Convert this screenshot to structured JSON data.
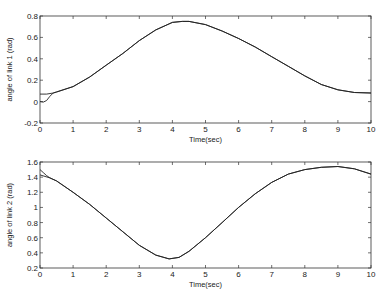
{
  "chart_data": [
    {
      "type": "line",
      "title": "",
      "xlabel": "Time(sec)",
      "ylabel": "angle of link 1 (rad)",
      "xlim": [
        0,
        10
      ],
      "ylim": [
        -0.2,
        0.8
      ],
      "xticks": [
        "0",
        "1",
        "2",
        "3",
        "4",
        "5",
        "6",
        "7",
        "8",
        "9",
        "10"
      ],
      "yticks": [
        "-0.2",
        "0",
        "0.2",
        "0.4",
        "0.6",
        "0.8"
      ],
      "grid": false,
      "series": [
        {
          "name": "actual",
          "x": [
            0,
            0.1,
            0.2,
            0.3,
            0.4,
            0.5,
            1,
            1.5,
            2,
            2.5,
            3,
            3.5,
            4,
            4.3,
            4.5,
            5,
            5.5,
            6,
            6.5,
            7,
            7.5,
            8,
            8.5,
            9,
            9.5,
            10
          ],
          "values": [
            0.0,
            -0.005,
            0.01,
            0.05,
            0.08,
            0.09,
            0.14,
            0.23,
            0.34,
            0.45,
            0.57,
            0.67,
            0.74,
            0.75,
            0.75,
            0.72,
            0.66,
            0.59,
            0.51,
            0.42,
            0.33,
            0.24,
            0.16,
            0.11,
            0.085,
            0.08
          ]
        },
        {
          "name": "reference",
          "x": [
            0,
            0.2,
            0.4,
            0.5,
            1,
            1.5,
            2,
            2.5,
            3,
            3.5,
            4,
            4.3,
            4.5,
            5,
            5.5,
            6,
            6.5,
            7,
            7.5,
            8,
            8.5,
            9,
            9.5,
            10
          ],
          "values": [
            0.07,
            0.07,
            0.08,
            0.09,
            0.14,
            0.23,
            0.34,
            0.45,
            0.57,
            0.67,
            0.74,
            0.75,
            0.75,
            0.72,
            0.66,
            0.59,
            0.51,
            0.42,
            0.33,
            0.24,
            0.16,
            0.11,
            0.085,
            0.08
          ]
        }
      ]
    },
    {
      "type": "line",
      "title": "",
      "xlabel": "Time(sec)",
      "ylabel": "angle of link 2 (rad)",
      "xlim": [
        0,
        10
      ],
      "ylim": [
        0.2,
        1.6
      ],
      "xticks": [
        "0",
        "1",
        "2",
        "3",
        "4",
        "5",
        "6",
        "7",
        "8",
        "9",
        "10"
      ],
      "yticks": [
        "0.2",
        "0.4",
        "0.6",
        "0.8",
        "1",
        "1.2",
        "1.4",
        "1.6"
      ],
      "grid": false,
      "series": [
        {
          "name": "actual",
          "x": [
            0,
            0.1,
            0.2,
            0.3,
            0.5,
            1,
            1.5,
            2,
            2.5,
            3,
            3.5,
            3.9,
            4.2,
            4.5,
            5,
            5.5,
            6,
            6.5,
            7,
            7.5,
            8,
            8.5,
            9,
            9.5,
            10
          ],
          "values": [
            1.5,
            1.46,
            1.42,
            1.39,
            1.35,
            1.2,
            1.04,
            0.86,
            0.68,
            0.5,
            0.37,
            0.32,
            0.34,
            0.42,
            0.6,
            0.8,
            1.0,
            1.18,
            1.33,
            1.44,
            1.5,
            1.53,
            1.54,
            1.51,
            1.44
          ]
        },
        {
          "name": "reference",
          "x": [
            0,
            0.3,
            0.5,
            1,
            1.5,
            2,
            2.5,
            3,
            3.5,
            3.9,
            4.2,
            4.5,
            5,
            5.5,
            6,
            6.5,
            7,
            7.5,
            8,
            8.5,
            9,
            9.5,
            10
          ],
          "values": [
            1.43,
            1.39,
            1.35,
            1.2,
            1.04,
            0.86,
            0.68,
            0.5,
            0.37,
            0.32,
            0.34,
            0.42,
            0.6,
            0.8,
            1.0,
            1.18,
            1.33,
            1.44,
            1.5,
            1.53,
            1.54,
            1.51,
            1.44
          ]
        }
      ]
    }
  ]
}
